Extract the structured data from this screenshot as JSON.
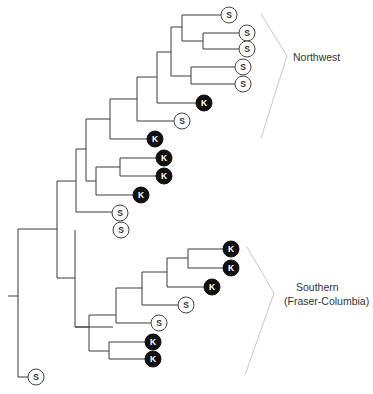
{
  "diagram": {
    "type": "phylogenetic-tree",
    "colors": {
      "line": "#3a3a3a",
      "bracket": "#c8c8c8",
      "k_fill": "#111111",
      "s_fill": "#ffffff",
      "text_dark": "#333333"
    },
    "legend_symbols": {
      "S": "S",
      "K": "K"
    },
    "groups": [
      {
        "name": "Northwest",
        "label_lines": [
          "Northwest"
        ],
        "bracket": [
          [
            261,
            14
          ],
          [
            287,
            56
          ],
          [
            261,
            138
          ]
        ],
        "label_pos": [
          293,
          51
        ]
      },
      {
        "name": "Southern",
        "label_lines": [
          "Southern",
          "(Fraser-Columbia)"
        ],
        "bracket": [
          [
            247,
            247
          ],
          [
            274,
            293
          ],
          [
            245,
            375
          ]
        ],
        "label_pos": [
          284,
          281
        ]
      }
    ],
    "leaves": [
      {
        "id": "l1",
        "type": "S",
        "x": 229,
        "y": 15
      },
      {
        "id": "l2",
        "type": "S",
        "x": 247,
        "y": 33
      },
      {
        "id": "l3",
        "type": "S",
        "x": 247,
        "y": 49
      },
      {
        "id": "l4",
        "type": "S",
        "x": 243,
        "y": 67
      },
      {
        "id": "l5",
        "type": "S",
        "x": 243,
        "y": 84
      },
      {
        "id": "l6",
        "type": "K",
        "x": 204,
        "y": 103
      },
      {
        "id": "l7",
        "type": "S",
        "x": 182,
        "y": 121
      },
      {
        "id": "l8",
        "type": "K",
        "x": 155,
        "y": 139
      },
      {
        "id": "l9",
        "type": "K",
        "x": 164,
        "y": 158
      },
      {
        "id": "l10",
        "type": "K",
        "x": 164,
        "y": 176
      },
      {
        "id": "l11",
        "type": "K",
        "x": 141,
        "y": 195
      },
      {
        "id": "l12",
        "type": "S",
        "x": 120,
        "y": 213
      },
      {
        "id": "l13",
        "type": "S",
        "x": 121,
        "y": 230
      },
      {
        "id": "l14",
        "type": "K",
        "x": 231,
        "y": 249
      },
      {
        "id": "l15",
        "type": "K",
        "x": 231,
        "y": 268
      },
      {
        "id": "l16",
        "type": "K",
        "x": 212,
        "y": 287
      },
      {
        "id": "l17",
        "type": "S",
        "x": 186,
        "y": 305
      },
      {
        "id": "l18",
        "type": "S",
        "x": 159,
        "y": 323
      },
      {
        "id": "l19",
        "type": "K",
        "x": 153,
        "y": 342
      },
      {
        "id": "l20",
        "type": "K",
        "x": 153,
        "y": 359
      },
      {
        "id": "l21",
        "type": "S",
        "x": 36,
        "y": 377
      }
    ],
    "edges": [
      "M8,296 H18",
      "M18,229 V377 H28",
      "M18,229 H57",
      "M57,181 V278",
      "M57,181 H76",
      "M76,149 V212 H112",
      "M76,149 H86",
      "M86,119 V181 H96",
      "M86,119 H110",
      "M110,99 V139 H147",
      "M110,99 H137",
      "M137,77 V121 H174",
      "M137,77 H157",
      "M157,52 V103 H196",
      "M157,52 H171",
      "M171,27 V76 H191",
      "M171,27 H182",
      "M182,15 H221",
      "M182,15 V41 H203",
      "M203,33 V49",
      "M203,33 H239",
      "M203,49 H239",
      "M191,67 V84",
      "M191,67 H235",
      "M191,84 H235",
      "M96,167 V195 H133",
      "M96,167 H120",
      "M120,158 V176",
      "M120,158 H156",
      "M120,176 H156",
      "M57,278 H75",
      "M75,230 V327 H113",
      "M75,327 H89",
      "M89,315 V351 H109",
      "M109,342 V359",
      "M109,342 H145",
      "M109,359 H145",
      "M89,315 H116",
      "M116,288 V323 H151",
      "M116,288 H142",
      "M142,272 V305 H178",
      "M142,272 H167",
      "M167,258 V287 H204",
      "M167,258 H188",
      "M188,249 V268",
      "M188,249 H223",
      "M188,268 H223"
    ]
  },
  "labels": {
    "northwest": "Northwest",
    "southern_line1": "Southern",
    "southern_line2": "(Fraser-Columbia)"
  }
}
